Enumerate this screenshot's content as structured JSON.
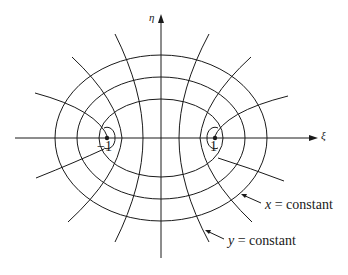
{
  "figure": {
    "type": "elliptic coordinate system",
    "axes": {
      "horizontal_label": "ξ",
      "vertical_label": "η"
    },
    "foci": [
      {
        "label": "−1",
        "x_value": -1
      },
      {
        "label": "1",
        "x_value": 1
      }
    ],
    "annotations": {
      "x_curve": {
        "var": "x",
        "text": " = constant",
        "describes": "confocal ellipses"
      },
      "y_curve": {
        "var": "y",
        "text": " = constant",
        "describes": "confocal hyperbolas"
      }
    },
    "colors": {
      "line": "#1a1a1a",
      "background": "#ffffff"
    }
  }
}
